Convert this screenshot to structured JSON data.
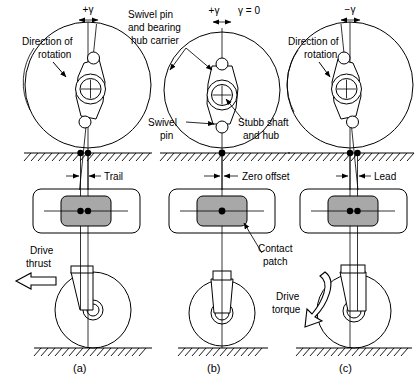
{
  "figure": {
    "colors": {
      "line": "#000000",
      "contact_patch_fill": "#a8a8a8",
      "background": "#ffffff"
    },
    "panels": [
      {
        "id": "a",
        "caption": "(a)",
        "angle_label": "+γ",
        "angle_sign": "positive",
        "offset_label": "Trail",
        "force_label_line1": "Drive",
        "force_label_line2": "thrust",
        "rotation_label_line1": "Direction of",
        "rotation_label_line2": "rotation",
        "contact_dots": 2
      },
      {
        "id": "b",
        "caption": "(b)",
        "angle_label": "+γ",
        "angle_label_2": "γ = 0",
        "angle_sign": "zero",
        "offset_label": "Zero offset",
        "callout_swivel_line1": "Swivel",
        "callout_swivel_line2": "pin",
        "callout_stubb_line1": "Stubb shaft",
        "callout_stubb_line2": "and hub",
        "callout_hub_line1": "Swivel pin",
        "callout_hub_line2": "and bearing",
        "callout_hub_line3": "hub carrier",
        "callout_patch_line1": "Contact",
        "callout_patch_line2": "patch",
        "contact_dots": 1
      },
      {
        "id": "c",
        "caption": "(c)",
        "angle_label": "−γ",
        "angle_sign": "negative",
        "offset_label": "Lead",
        "force_label_line1": "Drive",
        "force_label_line2": "torque",
        "rotation_label_line1": "Direction of",
        "rotation_label_line2": "rotation",
        "contact_dots": 2
      }
    ],
    "icons": {
      "rotation_arrow": "curved-arrow-icon",
      "thrust_arrow": "hollow-left-arrow-icon",
      "torque_arrow": "curved-down-arrow-icon",
      "dimension_arrow": "dimension-arrow-icon",
      "ground_hatch": "ground-hatch-icon"
    }
  }
}
